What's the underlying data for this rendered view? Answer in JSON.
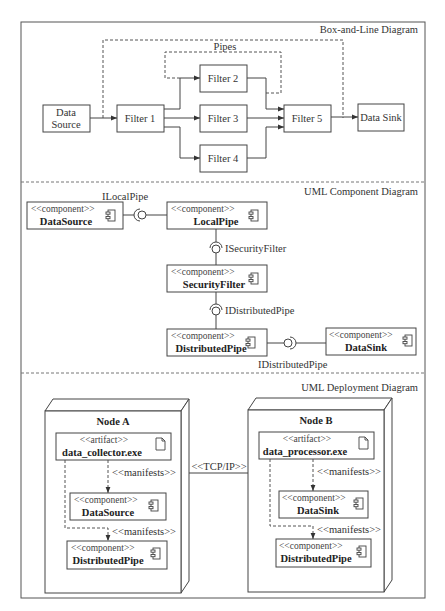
{
  "sections": {
    "box_and_line": {
      "title": "Box-and-Line Diagram",
      "pipes_label": "Pipes",
      "boxes": {
        "data_source": [
          "Data",
          "Source"
        ],
        "filter1": "Filter 1",
        "filter2": "Filter 2",
        "filter3": "Filter 3",
        "filter4": "Filter 4",
        "filter5": "Filter 5",
        "data_sink": "Data Sink"
      }
    },
    "component": {
      "title": "UML Component Diagram",
      "stereotype": "<<component>>",
      "components": {
        "data_source": "DataSource",
        "local_pipe": "LocalPipe",
        "security_filter": "SecurityFilter",
        "distributed_pipe": "DistributedPipe",
        "data_sink": "DataSink"
      },
      "interfaces": {
        "local_pipe": "ILocalPipe",
        "security_filter": "ISecurityFilter",
        "distributed_pipe_1": "IDistributedPipe",
        "distributed_pipe_2": "IDistributedPipe"
      }
    },
    "deployment": {
      "title": "UML Deployment Diagram",
      "connection_label": "<<TCP/IP>>",
      "artifact_stereotype": "<<artifact>>",
      "component_stereotype": "<<component>>",
      "manifests_label": "<<manifests>>",
      "node_a": {
        "name": "Node A",
        "artifact": "data_collector.exe",
        "components": [
          "DataSource",
          "DistributedPipe"
        ]
      },
      "node_b": {
        "name": "Node B",
        "artifact": "data_processor.exe",
        "components": [
          "DataSink",
          "DistributedPipe"
        ]
      }
    }
  }
}
